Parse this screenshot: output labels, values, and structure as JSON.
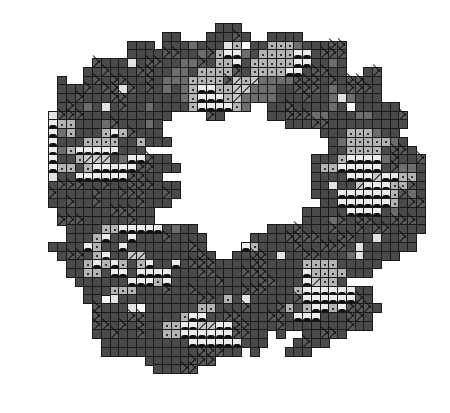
{
  "pattern": {
    "description": "Ring-shaped grid mosaic pattern",
    "cell_pitch_px": 8.75,
    "origin": {
      "x": 22,
      "y": 23
    },
    "legend": {
      "D": {
        "name": "dark-gray-cell",
        "color": "#4a4a4a"
      },
      "M": {
        "name": "mid-gray-cell",
        "color": "#6e6e6e"
      },
      "L": {
        "name": "light-gray-dot-cell",
        "color": "#b4b4b4"
      },
      "E": {
        "name": "pale-blank-cell",
        "color": "#e2e2e2"
      },
      "W": {
        "name": "white-wave-cell",
        "color": "#ececec"
      },
      "X": {
        "name": "crossed-cell",
        "color": "#5a5a5a"
      },
      "H": {
        "name": "hatched-cell",
        "color": "#c8c8c8"
      }
    },
    "rows": [
      "......................DDD.....................",
      "................DD...DDDXD..DDDD..............",
      "............DDD.DDDMDDDEL.DDLLLMDDDXX.........",
      "............DDDDXXDDMXLWWMDLLLLWWDXXX.........",
      "........XDDDEDXXDDMMXDLLWDLLLLLWWDDMD.........",
      ".......DDXDDDXXDDMMDLLLLXDLLLLWWDXXDD..DX......",
      "....D..DXDXXDDXDMMMLLLLXHLHMMMMXXXDXDXXDD.....",
      "....DDDXDXXEXDXDMDMLWWLLHHMMMDDXXXDMDXXXD.....",
      "....DDXDDDXXDDDDDDMLWWWLHMMMMDDDXDDMEMDDD.....",
      "....DXDMDEDXDDMDDDDLWWWWLM..DDXDDDDMD.DDDDD...",
      "...EXXXDDDDDDDDDD....XD.....DDXXXMMDDDMMDDDX..",
      "...WLLDDDMXDDDMD..............DDDXXDDDDDDDDD..",
      "...WMLDDDLWLXDDD..................DDDLLLMDD...",
      "...WDDDLLLLDDLDDD..................DMLLLLLMD..",
      "...WMLWWWWWDDD.....................DDLLLLDXXD.",
      "...WDDLHHHDMWWXDD................DDDLWWWWMXDDX",
      "...WLLDLWWWWWXXDDD...............DLLWWWWWDXMMD",
      "...EDDWWWWWWXXDD.................DDDDWWWHWWLLD",
      "...DXXXDDXDDXXXDDD...............DDEDDHWWWLLXD",
      "...XDDDDXDDXXXDDXD...............DDDWWWWWWLXMD",
      "...DDXDDXDDDDXDDD.................DDWWWWWWLDXX",
      "....DDDDDDXXXDD.................DDDDDWWWWDMDDD",
      "....XXXDDDDDXDD.................DDDMXDXXDDXXXD",
      ".....DDDDLLWWWWWDMDD........DDDXDDDXDDXDXXDDDD",
      ".....DDDLWDDWDDDXDDDD.....DDDDXXXXDDXXDDEDDXD.",
      "...DDDDWLDDWDDDDDDDXD....WLDDDDXDDXXXDEDDDDDD.",
      "....DXXDLWDDHHDDDDDDXD..DDXXDEDDXXDDDMEDDDD...",
      ".....DDLWLWLDLWDDWDXXXDDDDXXDDDDLLLLDDDDD.....",
      ".....DDLLDWWDWWWWDDDXXDDDXXXDDDDWLLLLDDD......",
      "......DDDDDDWWWLWDDDDDXDDDDXXDDDWHLLD.........",
      ".......DDDLLLDDDXDDXDDDDDXXXDDDLWWWWWWDD......",
      ".......DD.EDDDDDDDDDXXDLDEDDDDDXWWWWWWXD......",
      "........XDDDE.DDDDDDLLDDDXDDDXLDLWWLWXXXD.....",
      "........XDDDXXDDDDLWWDDXXDDDXXDWWWDDDXXD......",
      "........XXDXDXDDLLWWHHWWXXDDDXDDDDDDDXDD......",
      "........DDXDDXDDLLWWWWWWXXDD.D..DDXXD.........",
      ".........DDDDDDDDDDWWWWWWDDD...DXDD...........",
      ".........DDDDDDDDDDDXXXDD.D...DDD.............",
      "..............DDDDDXXX.......................",
      "...............DDDXX........................."
    ]
  }
}
